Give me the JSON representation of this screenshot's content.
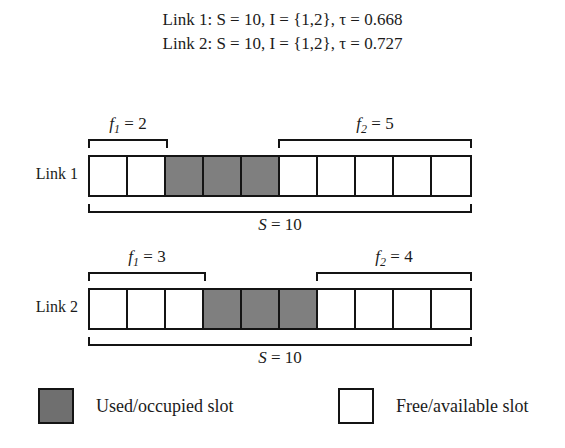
{
  "caption": {
    "line1": "Link 1: S = 10, I = {1,2}, τ = 0.668",
    "line2": "Link 2: S = 10, I = {1,2}, τ = 0.727"
  },
  "colors": {
    "occupied": "#7f7f7f",
    "free": "#ffffff",
    "stroke": "#141414"
  },
  "links": [
    {
      "label": "Link 1",
      "total_label": "S = 10",
      "total_slots": 10,
      "slots": [
        "free",
        "free",
        "used",
        "used",
        "used",
        "free",
        "free",
        "free",
        "free",
        "free"
      ],
      "fragments": [
        {
          "name": "f1",
          "label": "f₁ = 2",
          "value": 2,
          "start_slot": 1,
          "end_slot": 2
        },
        {
          "name": "f2",
          "label": "f₂ = 5",
          "value": 5,
          "start_slot": 6,
          "end_slot": 10
        }
      ]
    },
    {
      "label": "Link 2",
      "total_label": "S = 10",
      "total_slots": 10,
      "slots": [
        "free",
        "free",
        "free",
        "used",
        "used",
        "used",
        "free",
        "free",
        "free",
        "free"
      ],
      "fragments": [
        {
          "name": "f1",
          "label": "f₁ = 3",
          "value": 3,
          "start_slot": 1,
          "end_slot": 3
        },
        {
          "name": "f2",
          "label": "f₂ = 4",
          "value": 4,
          "start_slot": 7,
          "end_slot": 10
        }
      ]
    }
  ],
  "legend": {
    "used_label": "Used/occupied slot",
    "free_label": "Free/available slot"
  },
  "chart_data": {
    "type": "diagram",
    "notes": [
      "Link 1: S = 10, I = {1,2}, τ = 0.668",
      "Link 2: S = 10, I = {1,2}, τ = 0.727"
    ],
    "series": [
      {
        "name": "Link 1",
        "slot_states": [
          "free",
          "free",
          "used",
          "used",
          "used",
          "free",
          "free",
          "free",
          "free",
          "free"
        ],
        "free_fragments": [
          {
            "label": "f1",
            "size": 2,
            "slots": [
              1,
              2
            ]
          },
          {
            "label": "f2",
            "size": 5,
            "slots": [
              6,
              7,
              8,
              9,
              10
            ]
          }
        ],
        "total": 10,
        "tau": 0.668,
        "I": [
          1,
          2
        ]
      },
      {
        "name": "Link 2",
        "slot_states": [
          "free",
          "free",
          "free",
          "used",
          "used",
          "used",
          "free",
          "free",
          "free",
          "free"
        ],
        "free_fragments": [
          {
            "label": "f1",
            "size": 3,
            "slots": [
              1,
              2,
              3
            ]
          },
          {
            "label": "f2",
            "size": 4,
            "slots": [
              7,
              8,
              9,
              10
            ]
          }
        ],
        "total": 10,
        "tau": 0.727,
        "I": [
          1,
          2
        ]
      }
    ],
    "legend": [
      "Used/occupied slot",
      "Free/available slot"
    ]
  }
}
